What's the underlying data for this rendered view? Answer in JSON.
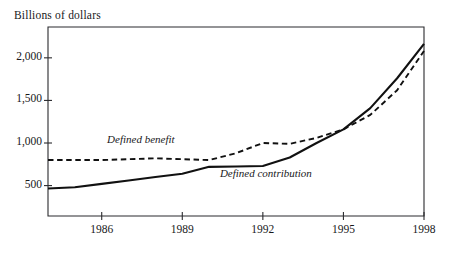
{
  "chart_data": {
    "type": "line",
    "title": "Billions of dollars",
    "xlabel": "",
    "ylabel": "Billions of dollars",
    "xlim": [
      1984.0,
      1998.0
    ],
    "ylim": [
      143,
      2362
    ],
    "grid": false,
    "legend_position": "inline-annotations",
    "x_ticks": [
      "1986",
      "1989",
      "1992",
      "1995",
      "1998"
    ],
    "x_tick_values": [
      1986,
      1989,
      1992,
      1995,
      1998
    ],
    "y_ticks": [
      "500",
      "1,000",
      "1,500",
      "2,000"
    ],
    "y_tick_values": [
      500,
      1000,
      1500,
      2000
    ],
    "x": [
      1984.0,
      1985,
      1986,
      1987,
      1988,
      1989,
      1990,
      1991,
      1992,
      1993,
      1994,
      1995,
      1996,
      1997,
      1998
    ],
    "series": [
      {
        "name": "Defined benefit",
        "style": "dashed",
        "color": "#111111",
        "values": [
          800,
          800,
          800,
          810,
          820,
          810,
          800,
          880,
          1000,
          990,
          1060,
          1160,
          1330,
          1620,
          2080
        ]
      },
      {
        "name": "Defined contribution",
        "style": "solid",
        "color": "#111111",
        "values": [
          465,
          480,
          520,
          560,
          600,
          640,
          720,
          725,
          730,
          830,
          1000,
          1160,
          1410,
          1760,
          2165
        ]
      }
    ],
    "annotations": [
      {
        "text": "Defined benefit",
        "x": 1986.2,
        "y": 1040
      },
      {
        "text": "Defined contribution",
        "x": 1990.4,
        "y": 640
      }
    ]
  }
}
